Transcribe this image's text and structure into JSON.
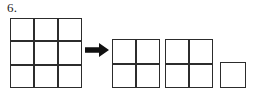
{
  "problem": {
    "number_label": "6.",
    "line_color": "#2c2c2c",
    "background_color": "#ffffff"
  },
  "diagram": {
    "type": "area-model-decomposition",
    "source_shape": {
      "name": "three-by-three-grid",
      "rows": 3,
      "columns": 3,
      "cell_count": 9
    },
    "relation_symbol": "arrow-right",
    "result_shapes": [
      {
        "name": "two-by-two-grid",
        "rows": 2,
        "columns": 2,
        "cell_count": 4
      },
      {
        "name": "two-by-two-grid",
        "rows": 2,
        "columns": 2,
        "cell_count": 4
      },
      {
        "name": "unit-square",
        "rows": 1,
        "columns": 1,
        "cell_count": 1
      }
    ]
  }
}
